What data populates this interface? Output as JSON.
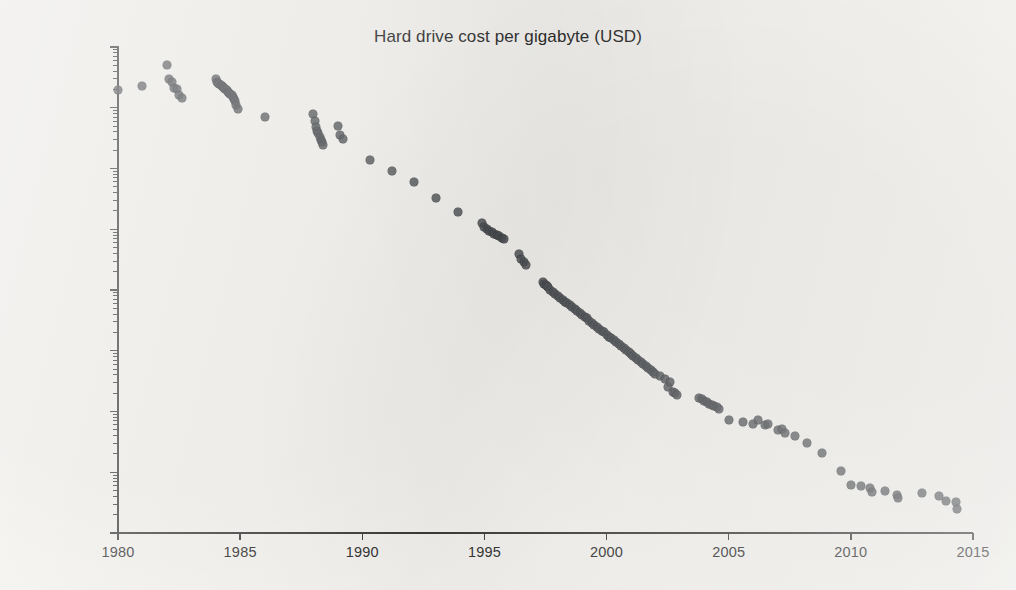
{
  "chart_data": {
    "type": "scatter",
    "title": "Hard drive cost per gigabyte (USD)",
    "xlabel": "",
    "ylabel": "",
    "grid": false,
    "legend": "none",
    "yscale": "log",
    "xscale": "linear",
    "xlim": [
      1980,
      2015
    ],
    "ylim": [
      0.01,
      1000000
    ],
    "xticks": [
      1980,
      1985,
      1990,
      1995,
      2000,
      2005,
      2010,
      2015
    ],
    "xticklabels": [
      "1980",
      "1985",
      "1990",
      "1995",
      "2000",
      "2005",
      "2010",
      "2015"
    ],
    "yticks": [
      1000000,
      100000,
      10000,
      1000,
      100,
      10,
      1,
      0.1,
      0.01
    ],
    "yticklabels": [
      "$1 000 000.00",
      "$100 000.00",
      "$10 000.00",
      "$1 000.00",
      "$100.00",
      "$10.00",
      "$1.00",
      "$0.10",
      "$0.01"
    ],
    "marker": {
      "shape": "circle",
      "color": "#4b4e52",
      "size": 9,
      "opacity": 0.84
    },
    "series": [
      {
        "name": "Hard drive cost per gigabyte",
        "x": [
          1980.0,
          1981.0,
          1982.0,
          1982.1,
          1982.2,
          1982.3,
          1982.4,
          1982.5,
          1982.6,
          1984.0,
          1984.05,
          1984.1,
          1984.15,
          1984.2,
          1984.25,
          1984.3,
          1984.35,
          1984.4,
          1984.45,
          1984.5,
          1984.55,
          1984.6,
          1984.65,
          1984.7,
          1984.75,
          1984.8,
          1984.85,
          1984.9,
          1986.0,
          1988.0,
          1988.05,
          1988.1,
          1988.15,
          1988.2,
          1988.25,
          1988.3,
          1988.35,
          1988.4,
          1989.0,
          1989.1,
          1989.2,
          1990.3,
          1991.2,
          1992.1,
          1993.0,
          1993.9,
          1994.9,
          1995.0,
          1995.1,
          1995.2,
          1995.3,
          1995.4,
          1995.5,
          1995.6,
          1995.7,
          1995.8,
          1996.4,
          1996.5,
          1996.6,
          1996.7,
          1997.4,
          1997.45,
          1997.5,
          1997.55,
          1997.6,
          1997.7,
          1997.8,
          1997.9,
          1998.0,
          1998.1,
          1998.2,
          1998.3,
          1998.4,
          1998.5,
          1998.6,
          1998.7,
          1998.8,
          1998.9,
          1999.0,
          1999.1,
          1999.2,
          1999.3,
          1999.4,
          1999.5,
          1999.6,
          1999.7,
          1999.8,
          1999.9,
          2000.0,
          2000.1,
          2000.2,
          2000.3,
          2000.4,
          2000.5,
          2000.6,
          2000.7,
          2000.8,
          2000.9,
          2001.0,
          2001.1,
          2001.2,
          2001.3,
          2001.4,
          2001.5,
          2001.6,
          2001.7,
          2001.8,
          2001.9,
          2002.0,
          2002.2,
          2002.4,
          2002.5,
          2002.6,
          2002.7,
          2002.8,
          2002.9,
          2003.8,
          2003.9,
          2004.0,
          2004.1,
          2004.2,
          2004.3,
          2004.4,
          2004.5,
          2004.6,
          2005.0,
          2005.6,
          2006.0,
          2006.2,
          2006.5,
          2006.6,
          2007.0,
          2007.2,
          2007.3,
          2007.7,
          2008.2,
          2008.8,
          2009.6,
          2010.0,
          2010.4,
          2010.8,
          2010.85,
          2011.4,
          2011.9,
          2011.95,
          2012.9,
          2013.6,
          2013.9,
          2014.3,
          2014.35
        ],
        "y": [
          193000,
          230000,
          500000,
          300000,
          270000,
          215000,
          200000,
          160000,
          145000,
          300000,
          270000,
          260000,
          250000,
          240000,
          230000,
          220000,
          210000,
          200000,
          195000,
          185000,
          175000,
          170000,
          160000,
          150000,
          140000,
          130000,
          110000,
          95000,
          71000,
          80000,
          60000,
          48000,
          42000,
          38000,
          33000,
          30000,
          27000,
          24000,
          50000,
          36000,
          31000,
          14000,
          9000,
          6000,
          3300,
          1900,
          1250,
          1100,
          1000,
          950,
          900,
          850,
          800,
          760,
          720,
          680,
          390,
          330,
          290,
          255,
          135,
          125,
          120,
          115,
          110,
          100,
          92,
          85,
          80,
          74,
          69,
          64,
          60,
          56,
          52,
          48,
          45,
          42,
          39,
          36,
          34,
          31,
          29,
          27,
          25,
          23,
          21,
          20,
          18.5,
          17,
          16,
          15,
          14,
          13,
          12,
          11,
          10.2,
          9.5,
          8.8,
          8.2,
          7.6,
          7.0,
          6.5,
          6.0,
          5.6,
          5.2,
          4.9,
          4.5,
          4.2,
          3.8,
          3.4,
          2.5,
          3.1,
          2.1,
          2.0,
          1.85,
          1.7,
          1.6,
          1.5,
          1.45,
          1.35,
          1.3,
          1.25,
          1.2,
          1.1,
          0.72,
          0.68,
          0.63,
          0.72,
          0.6,
          0.62,
          0.5,
          0.52,
          0.45,
          0.4,
          0.3,
          0.21,
          0.105,
          0.062,
          0.06,
          0.055,
          0.048,
          0.05,
          0.042,
          0.038,
          0.045,
          0.04,
          0.034,
          0.032,
          0.025
        ]
      }
    ]
  }
}
